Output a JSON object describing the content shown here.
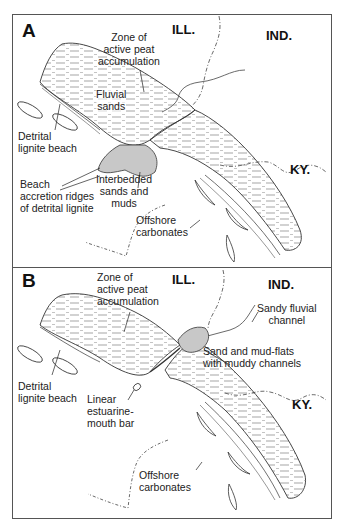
{
  "figure": {
    "panels": [
      {
        "letter": "A",
        "states": [
          "ILL.",
          "IND.",
          "KY."
        ],
        "labels": {
          "peat": "Zone of\nactive peat\naccumulation",
          "fluvial": "Fluvial\nsands",
          "beach": "Detrital\nlignite beach",
          "ridges": "Beach\naccretion ridges\nof detrital lignite",
          "interbedded": "Interbedded\nsands and\nmuds",
          "offshore": "Offshore\ncarbonates"
        }
      },
      {
        "letter": "B",
        "states": [
          "ILL.",
          "IND.",
          "KY."
        ],
        "labels": {
          "peat": "Zone of\nactive peat\naccumulation",
          "channel": "Sandy fluvial\nchannel",
          "flats": "Sand and mud-flats\nwith muddy channels",
          "beach": "Detrital\nlignite beach",
          "bar": "Linear\nestuarine-\nmouth bar",
          "offshore": "Offshore\ncarbonates"
        }
      }
    ],
    "colors": {
      "line": "#333333",
      "hatch": "#555555",
      "shade": "#c8c8c8",
      "frame": "#555555"
    }
  }
}
